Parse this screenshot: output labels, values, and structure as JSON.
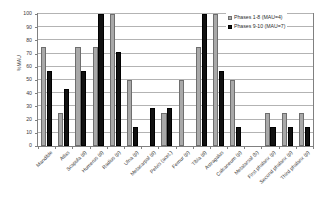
{
  "chart_data": {
    "type": "bar",
    "title": "",
    "subtitle": "",
    "xlabel": "",
    "ylabel": "%MAU",
    "ylim": [
      0,
      100
    ],
    "ytick_step": 10,
    "yticks": [
      0,
      10,
      20,
      30,
      40,
      50,
      60,
      70,
      80,
      90,
      100
    ],
    "grid": true,
    "legend_position": "top-right",
    "categories": [
      "Mandible",
      "Atlas",
      "Scapula (d)",
      "Humerus (d)",
      "Radius (p)",
      "Ulna (p)",
      "Metacarpal  (d)",
      "Pelvis (acet.)",
      "Femur (p)",
      "Tibia (d)",
      "Astragalus",
      "Calcaneum (p)",
      "Metatarsal (b)",
      "First phalanx (p)",
      "Second phalanx (p)",
      "Third phalanx (p)"
    ],
    "series": [
      {
        "name": "Phases 1-8 (MAU=4)",
        "color": "#a9a9a9",
        "values": [
          75,
          25,
          75,
          75,
          100,
          50,
          0,
          25,
          50,
          75,
          100,
          50,
          0,
          25,
          25,
          25
        ]
      },
      {
        "name": "Phases 9-10 (MAU=7)",
        "color": "#111111",
        "values": [
          57,
          43,
          57,
          100,
          71.5,
          14.3,
          28.6,
          28.6,
          0,
          100,
          57,
          14.3,
          0,
          14.3,
          14.3,
          14.3
        ]
      }
    ]
  },
  "legend": {
    "items": [
      {
        "label": "Phases 1-8 (MAU=4)",
        "swatch": "a"
      },
      {
        "label": "Phases 9-10 (MAU=7)",
        "swatch": "b"
      }
    ]
  },
  "axis": {
    "y_title": "%MAU"
  }
}
